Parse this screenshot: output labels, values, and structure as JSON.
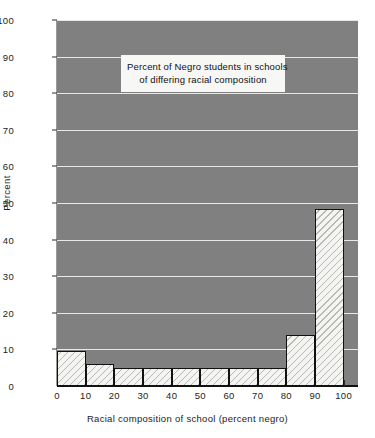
{
  "chart_data": {
    "type": "bar",
    "title": "Percent of Negro students in schools of differing racial composition",
    "title_line1": "Percent of Negro students in schools",
    "title_line2": "of differing racial composition",
    "xlabel": "Racial composition of school (percent negro)",
    "ylabel": "Percent",
    "xlim": [
      0,
      105
    ],
    "ylim": [
      0,
      100
    ],
    "grid": true,
    "legend": "none",
    "xtick_labels": [
      "0",
      "10",
      "20",
      "30",
      "40",
      "50",
      "60",
      "70",
      "80",
      "90",
      "100"
    ],
    "xtick_values": [
      0,
      10,
      20,
      30,
      40,
      50,
      60,
      70,
      80,
      90,
      100
    ],
    "ytick_labels": [
      "0",
      "10",
      "20",
      "30",
      "40",
      "50",
      "60",
      "70",
      "80",
      "90",
      "100"
    ],
    "ytick_values": [
      0,
      10,
      20,
      30,
      40,
      50,
      60,
      70,
      80,
      90,
      100
    ],
    "bin_edges": [
      0,
      10,
      20,
      30,
      40,
      50,
      60,
      70,
      80,
      90,
      100
    ],
    "categories": [
      "0-10",
      "10-20",
      "20-30",
      "30-40",
      "40-50",
      "50-60",
      "60-70",
      "70-80",
      "80-90",
      "90-100"
    ],
    "values": [
      9.7,
      6.0,
      5.0,
      5.0,
      5.0,
      5.0,
      5.0,
      5.0,
      14.0,
      48.5
    ],
    "bar_fill": "#f4f4f2",
    "bar_hatch": "diagonal-stripes",
    "bar_edge_color": "#111111",
    "plot_background": "#808080",
    "gridline_color": "#e8e8e8",
    "page_background": "#ffffff"
  }
}
